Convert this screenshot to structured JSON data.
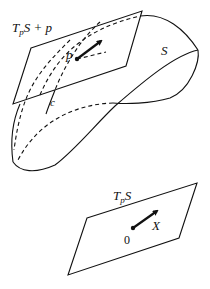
{
  "figure": {
    "top_cut_text": "",
    "upper": {
      "plane_label_main": "T",
      "plane_label_sub": "p",
      "plane_label_rest": "S + p",
      "point_label": "p",
      "surface_label": "S",
      "curve_label": "c"
    },
    "lower": {
      "plane_label_main": "T",
      "plane_label_sub": "p",
      "plane_label_rest": "S",
      "origin_label": "0",
      "vector_label": "X"
    },
    "colors": {
      "stroke": "#111111",
      "background": "#ffffff"
    }
  }
}
